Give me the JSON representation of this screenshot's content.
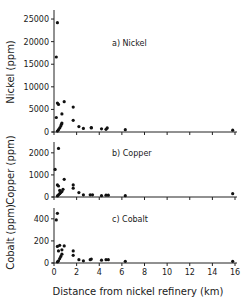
{
  "chart_data": [
    {
      "type": "scatter",
      "panel": "a",
      "title": "a) Nickel",
      "ylabel": "Nickel (ppm)",
      "xlabel": "",
      "xlim": [
        0,
        16
      ],
      "ylim": [
        0,
        27000
      ],
      "yticks": [
        0,
        5000,
        10000,
        15000,
        20000,
        25000
      ],
      "ytick_labels": [
        "0",
        "5000",
        "10000",
        "15000",
        "20000",
        "25000"
      ],
      "xticks": [
        0,
        2,
        4,
        6,
        8,
        10,
        12,
        14,
        16
      ],
      "grid": false,
      "points": [
        [
          0.3,
          24200
        ],
        [
          0.2,
          16600
        ],
        [
          0.3,
          6400
        ],
        [
          0.4,
          6100
        ],
        [
          0.9,
          6700
        ],
        [
          0.2,
          3200
        ],
        [
          0.7,
          4000
        ],
        [
          0.3,
          200
        ],
        [
          0.4,
          500
        ],
        [
          0.5,
          900
        ],
        [
          0.6,
          1300
        ],
        [
          0.65,
          1700
        ],
        [
          0.7,
          2000
        ],
        [
          1.7,
          5500
        ],
        [
          1.7,
          2600
        ],
        [
          2.2,
          1200
        ],
        [
          2.6,
          800
        ],
        [
          3.3,
          900
        ],
        [
          3.3,
          1000
        ],
        [
          4.2,
          700
        ],
        [
          4.6,
          600
        ],
        [
          4.7,
          900
        ],
        [
          6.3,
          500
        ],
        [
          15.8,
          400
        ]
      ]
    },
    {
      "type": "scatter",
      "panel": "b",
      "title": "b) Copper",
      "ylabel": "Copper (ppm)",
      "xlabel": "",
      "xlim": [
        0,
        16
      ],
      "ylim": [
        0,
        2400
      ],
      "yticks": [
        0,
        1000,
        2000
      ],
      "ytick_labels": [
        "0",
        "1000",
        "2000"
      ],
      "xticks": [
        0,
        2,
        4,
        6,
        8,
        10,
        12,
        14,
        16
      ],
      "grid": false,
      "points": [
        [
          0.1,
          1250
        ],
        [
          0.4,
          2200
        ],
        [
          0.3,
          550
        ],
        [
          0.4,
          500
        ],
        [
          0.5,
          300
        ],
        [
          0.8,
          350
        ],
        [
          0.9,
          800
        ],
        [
          0.3,
          50
        ],
        [
          0.4,
          100
        ],
        [
          0.5,
          150
        ],
        [
          0.6,
          200
        ],
        [
          0.7,
          250
        ],
        [
          1.7,
          550
        ],
        [
          1.7,
          400
        ],
        [
          2.2,
          200
        ],
        [
          2.6,
          100
        ],
        [
          3.2,
          100
        ],
        [
          3.4,
          100
        ],
        [
          4.2,
          60
        ],
        [
          4.6,
          80
        ],
        [
          4.8,
          80
        ],
        [
          6.3,
          60
        ],
        [
          15.8,
          150
        ]
      ]
    },
    {
      "type": "scatter",
      "panel": "c",
      "title": "c) Cobalt",
      "ylabel": "Cobalt (ppm)",
      "xlabel": "Distance from nickel refinery (km)",
      "xlim": [
        0,
        16
      ],
      "ylim": [
        0,
        480
      ],
      "yticks": [
        0,
        200,
        400
      ],
      "ytick_labels": [
        "0",
        "200",
        "400"
      ],
      "xticks": [
        0,
        2,
        4,
        6,
        8,
        10,
        12,
        14,
        16
      ],
      "xtick_labels": [
        "0",
        "2",
        "4",
        "6",
        "8",
        "10",
        "12",
        "14",
        "16"
      ],
      "grid": false,
      "points": [
        [
          0.3,
          450
        ],
        [
          0.2,
          390
        ],
        [
          0.3,
          150
        ],
        [
          0.5,
          160
        ],
        [
          0.9,
          155
        ],
        [
          0.4,
          110
        ],
        [
          0.7,
          120
        ],
        [
          0.3,
          10
        ],
        [
          0.4,
          20
        ],
        [
          0.5,
          40
        ],
        [
          0.6,
          60
        ],
        [
          0.7,
          80
        ],
        [
          1.7,
          110
        ],
        [
          1.7,
          70
        ],
        [
          2.2,
          30
        ],
        [
          2.6,
          20
        ],
        [
          3.2,
          30
        ],
        [
          3.3,
          35
        ],
        [
          4.2,
          25
        ],
        [
          4.6,
          30
        ],
        [
          4.8,
          30
        ],
        [
          6.3,
          15
        ],
        [
          15.8,
          15
        ]
      ]
    }
  ],
  "figure": {
    "x_axis_label": "Distance from nickel refinery (km)",
    "panels": [
      {
        "title": "a) Nickel",
        "ylabel": "Nickel (ppm)"
      },
      {
        "title": "b) Copper",
        "ylabel": "Copper (ppm)"
      },
      {
        "title": "c) Cobalt",
        "ylabel": "Cobalt (ppm)"
      }
    ]
  }
}
